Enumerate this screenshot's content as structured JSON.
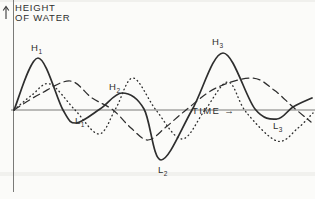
{
  "figure": {
    "y_axis_label_line1": "HEIGHT",
    "y_axis_label_line2": "OF WATER",
    "x_axis_label": "TIME →",
    "ink_color": "#2e2e2e",
    "axis_color": "#7a7a78",
    "paper_color": "#fbfbf9"
  },
  "chart_data": {
    "type": "line",
    "title": "",
    "xlabel": "TIME",
    "ylabel": "HEIGHT OF WATER",
    "axes_numeric": false,
    "grid": false,
    "coords": "screen-pixels (x rightward = time, y downward; baseline water level at y=110)",
    "baseline_y": 110,
    "series": [
      {
        "name": "resultant water height (solid)",
        "style": "solid",
        "points": [
          [
            14,
            110
          ],
          [
            38,
            58
          ],
          [
            63,
            110
          ],
          [
            76,
            123
          ],
          [
            100,
            109
          ],
          [
            122,
            93
          ],
          [
            144,
            109
          ],
          [
            161,
            160
          ],
          [
            192,
            110
          ],
          [
            223,
            53
          ],
          [
            255,
            109
          ],
          [
            277,
            119
          ],
          [
            293,
            107
          ],
          [
            312,
            98
          ]
        ]
      },
      {
        "name": "component wave, long period (dashed)",
        "style": "dashed",
        "points": [
          [
            14,
            110
          ],
          [
            40,
            94
          ],
          [
            70,
            81
          ],
          [
            92,
            98
          ],
          [
            113,
            110
          ],
          [
            131,
            128
          ],
          [
            148,
            140
          ],
          [
            166,
            127
          ],
          [
            186,
            110
          ],
          [
            216,
            88
          ],
          [
            252,
            78
          ],
          [
            274,
            90
          ],
          [
            293,
            107
          ],
          [
            311,
            122
          ]
        ]
      },
      {
        "name": "component wave, short period (dotted)",
        "style": "dotted",
        "points": [
          [
            14,
            110
          ],
          [
            32,
            95
          ],
          [
            50,
            84
          ],
          [
            75,
            110
          ],
          [
            99,
            134
          ],
          [
            116,
            108
          ],
          [
            133,
            78
          ],
          [
            156,
            110
          ],
          [
            182,
            139
          ],
          [
            205,
            110
          ],
          [
            228,
            82
          ],
          [
            246,
            112
          ],
          [
            277,
            141
          ],
          [
            298,
            128
          ],
          [
            313,
            113
          ]
        ]
      }
    ],
    "annotations": {
      "h1": {
        "base": "H",
        "sub": "1"
      },
      "h2": {
        "base": "H",
        "sub": "2"
      },
      "h3": {
        "base": "H",
        "sub": "3"
      },
      "l1": {
        "base": "L",
        "sub": "1"
      },
      "l2": {
        "base": "L",
        "sub": "2"
      },
      "l3": {
        "base": "L",
        "sub": "3"
      }
    }
  }
}
